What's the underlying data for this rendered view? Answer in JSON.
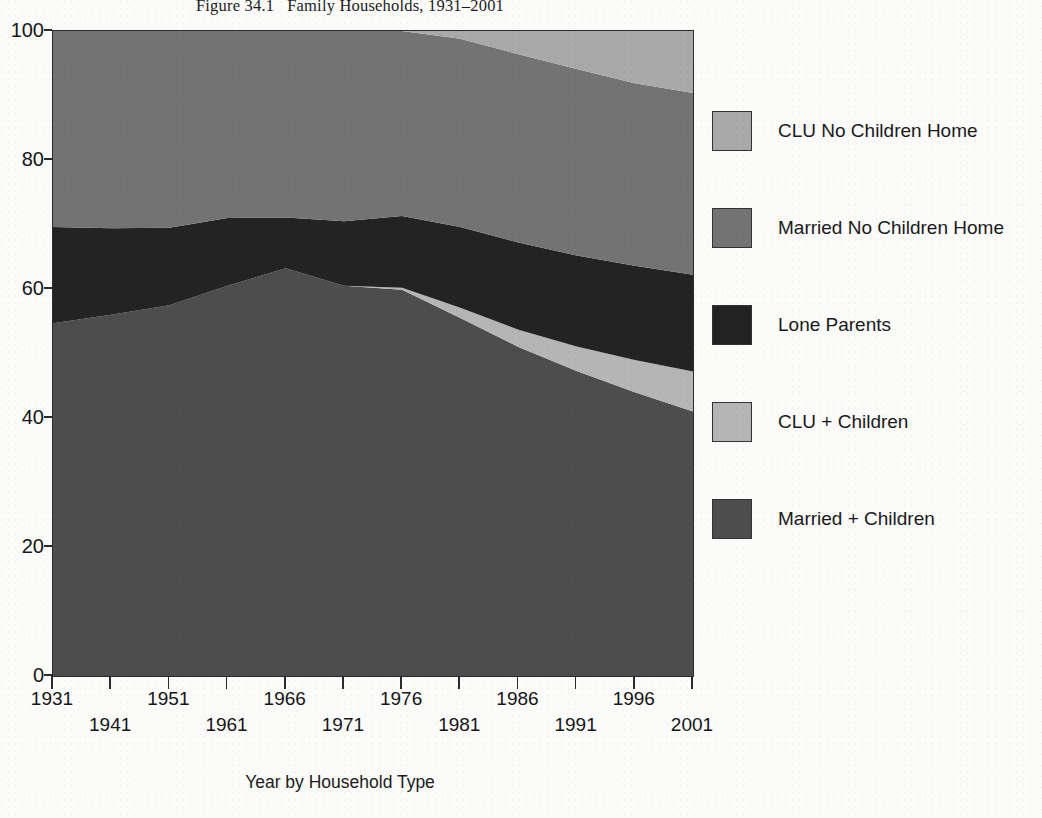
{
  "title": "Figure 34.1   Family Households, 1931–2001",
  "axis": {
    "x_title": "Year by Household Type",
    "y_tick_labels": [
      "0",
      "20",
      "40",
      "60",
      "80",
      "100"
    ],
    "x_tick_labels": [
      "1931",
      "1941",
      "1951",
      "1961",
      "1966",
      "1971",
      "1976",
      "1981",
      "1986",
      "1991",
      "1996",
      "2001"
    ]
  },
  "legend": {
    "items": [
      {
        "label": "CLU No Children Home",
        "color": "#a9a9a9"
      },
      {
        "label": "Married No Children Home",
        "color": "#737373"
      },
      {
        "label": "Lone Parents",
        "color": "#232323"
      },
      {
        "label": "CLU + Children",
        "color": "#b5b5b5"
      },
      {
        "label": "Married + Children",
        "color": "#4d4d4d"
      }
    ]
  },
  "chart_data": {
    "type": "area",
    "stacked": true,
    "title": "Figure 34.1   Family Households, 1931–2001",
    "xlabel": "Year by Household Type",
    "ylabel": "",
    "xlim": [
      1931,
      2001
    ],
    "ylim": [
      0,
      100
    ],
    "grid": false,
    "legend_position": "right",
    "categories": [
      "1931",
      "1941",
      "1951",
      "1961",
      "1966",
      "1971",
      "1976",
      "1981",
      "1986",
      "1991",
      "1996",
      "2001"
    ],
    "x": [
      1931,
      1941,
      1951,
      1961,
      1966,
      1971,
      1976,
      1981,
      1986,
      1991,
      1996,
      2001
    ],
    "series": [
      {
        "name": "Married + Children",
        "color": "#4d4d4d",
        "values": [
          54.7,
          56.0,
          57.5,
          60.5,
          63.2,
          60.5,
          59.9,
          55.5,
          51.0,
          47.3,
          44.0,
          41.0
        ]
      },
      {
        "name": "CLU + Children",
        "color": "#b5b5b5",
        "values": [
          0.0,
          0.0,
          0.0,
          0.0,
          0.0,
          0.0,
          0.3,
          1.6,
          2.7,
          3.8,
          5.0,
          6.2
        ]
      },
      {
        "name": "Lone Parents",
        "color": "#232323",
        "values": [
          14.9,
          13.4,
          12.0,
          10.5,
          7.9,
          10.0,
          11.1,
          12.5,
          13.5,
          14.1,
          14.6,
          15.0
        ]
      },
      {
        "name": "Married No Children Home",
        "color": "#737373",
        "values": [
          30.4,
          30.6,
          30.5,
          29.0,
          28.9,
          29.5,
          28.7,
          29.2,
          29.2,
          28.9,
          28.3,
          28.2
        ]
      },
      {
        "name": "CLU No Children Home",
        "color": "#a9a9a9",
        "values": [
          0.0,
          0.0,
          0.0,
          0.0,
          0.0,
          0.0,
          0.0,
          1.2,
          3.6,
          5.9,
          8.1,
          9.6
        ]
      }
    ],
    "y_ticks": [
      0,
      20,
      40,
      60,
      80,
      100
    ]
  },
  "geometry": {
    "plot_left": 52,
    "plot_top": 30,
    "plot_width": 640,
    "plot_height": 645
  }
}
